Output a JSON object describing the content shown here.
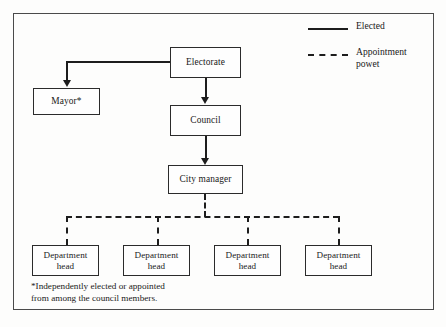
{
  "diagram": {
    "background_color": "#fdfdfc",
    "line_color": "#1d1d1d",
    "border_color": "#4a4a4a"
  },
  "nodes": [
    {
      "id": "electorate",
      "label": "Electorate"
    },
    {
      "id": "mayor",
      "label": "Mayor*"
    },
    {
      "id": "council",
      "label": "Council"
    },
    {
      "id": "city_manager",
      "label": "City manager"
    },
    {
      "id": "department_head_1",
      "label_line1": "Department",
      "label_line2": "head"
    },
    {
      "id": "department_head_2",
      "label_line1": "Department",
      "label_line2": "head"
    },
    {
      "id": "department_head_3",
      "label_line1": "Department",
      "label_line2": "head"
    },
    {
      "id": "department_head_4",
      "label_line1": "Department",
      "label_line2": "head"
    }
  ],
  "edges": [
    {
      "from": "electorate",
      "to": "mayor",
      "style": "solid",
      "meaning": "Elected"
    },
    {
      "from": "electorate",
      "to": "council",
      "style": "solid",
      "meaning": "Elected"
    },
    {
      "from": "council",
      "to": "city_manager",
      "style": "solid",
      "meaning": "Elected"
    },
    {
      "from": "city_manager",
      "to": "department_head_1",
      "style": "dashed",
      "meaning": "Appointment powet"
    },
    {
      "from": "city_manager",
      "to": "department_head_2",
      "style": "dashed",
      "meaning": "Appointment powet"
    },
    {
      "from": "city_manager",
      "to": "department_head_3",
      "style": "dashed",
      "meaning": "Appointment powet"
    },
    {
      "from": "city_manager",
      "to": "department_head_4",
      "style": "dashed",
      "meaning": "Appointment powet"
    }
  ],
  "legend": {
    "items": [
      {
        "style": "solid",
        "label": "Elected"
      },
      {
        "style": "dashed",
        "label": "Appointment\npowet"
      }
    ]
  },
  "footnote": {
    "text": "*Independently elected or appointed\nfrom among the council members."
  }
}
